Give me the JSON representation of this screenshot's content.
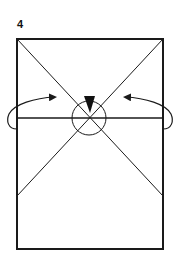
{
  "step": {
    "number": "4"
  },
  "diagram": {
    "paper": {
      "x": 17,
      "y": 39,
      "width": 146,
      "height": 210
    },
    "crease_lines": [
      {
        "name": "diagonal-top-left",
        "from": [
          17,
          39
        ],
        "to": [
          163,
          196
        ]
      },
      {
        "name": "diagonal-top-right",
        "from": [
          163,
          39
        ],
        "to": [
          17,
          196
        ]
      },
      {
        "name": "horizontal-fold-line",
        "from": [
          17,
          118
        ],
        "to": [
          163,
          118
        ]
      }
    ],
    "focus_circle": {
      "cx": 89,
      "cy": 118,
      "r": 17
    },
    "push_arrow": {
      "direction": "down",
      "tip": [
        89,
        113
      ]
    },
    "fold_arrows": [
      {
        "side": "left",
        "direction": "inward"
      },
      {
        "side": "right",
        "direction": "inward"
      }
    ],
    "colors": {
      "line": "#1a1a1a",
      "background": "#ffffff"
    }
  }
}
